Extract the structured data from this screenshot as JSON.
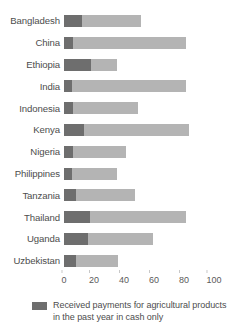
{
  "chart_data": {
    "type": "bar",
    "orientation": "horizontal",
    "stacked": true,
    "title": "",
    "subtitle": "",
    "xlabel": "",
    "ylabel": "",
    "xlim": [
      0,
      100
    ],
    "xticks": [
      0,
      20,
      40,
      60,
      80,
      100
    ],
    "xtick_labels": [
      "0",
      "20",
      "40",
      "60",
      "80",
      "100"
    ],
    "grid": false,
    "legend_position": "bottom-left",
    "categories": [
      "Bangladesh",
      "China",
      "Ethiopia",
      "India",
      "Indonesia",
      "Kenya",
      "Nigeria",
      "Philippines",
      "Tanzania",
      "Thailand",
      "Uganda",
      "Uzbekistan"
    ],
    "series": [
      {
        "name": "Received payments for agricultural products in the past year in cash only",
        "color": "#6e6e6e",
        "values": [
          12,
          6,
          18,
          5,
          6,
          13,
          6,
          5,
          8,
          17,
          16,
          8
        ]
      },
      {
        "name": "",
        "color": "#b4b4b4",
        "values": [
          39,
          75,
          17,
          76,
          43,
          70,
          35,
          30,
          39,
          64,
          43,
          28
        ]
      }
    ],
    "totals": [
      51,
      81,
      35,
      81,
      49,
      83,
      41,
      35,
      47,
      81,
      59,
      36
    ]
  },
  "legend": {
    "items": [
      {
        "swatch_name": "legend-swatch-dark",
        "color": "#6e6e6e",
        "label": "Received payments for agricultural products in the past year in cash only"
      }
    ]
  },
  "colors": {
    "segment_dark": "#6e6e6e",
    "segment_light": "#b4b4b4",
    "text": "#4d4d4d",
    "background": "#ffffff"
  }
}
